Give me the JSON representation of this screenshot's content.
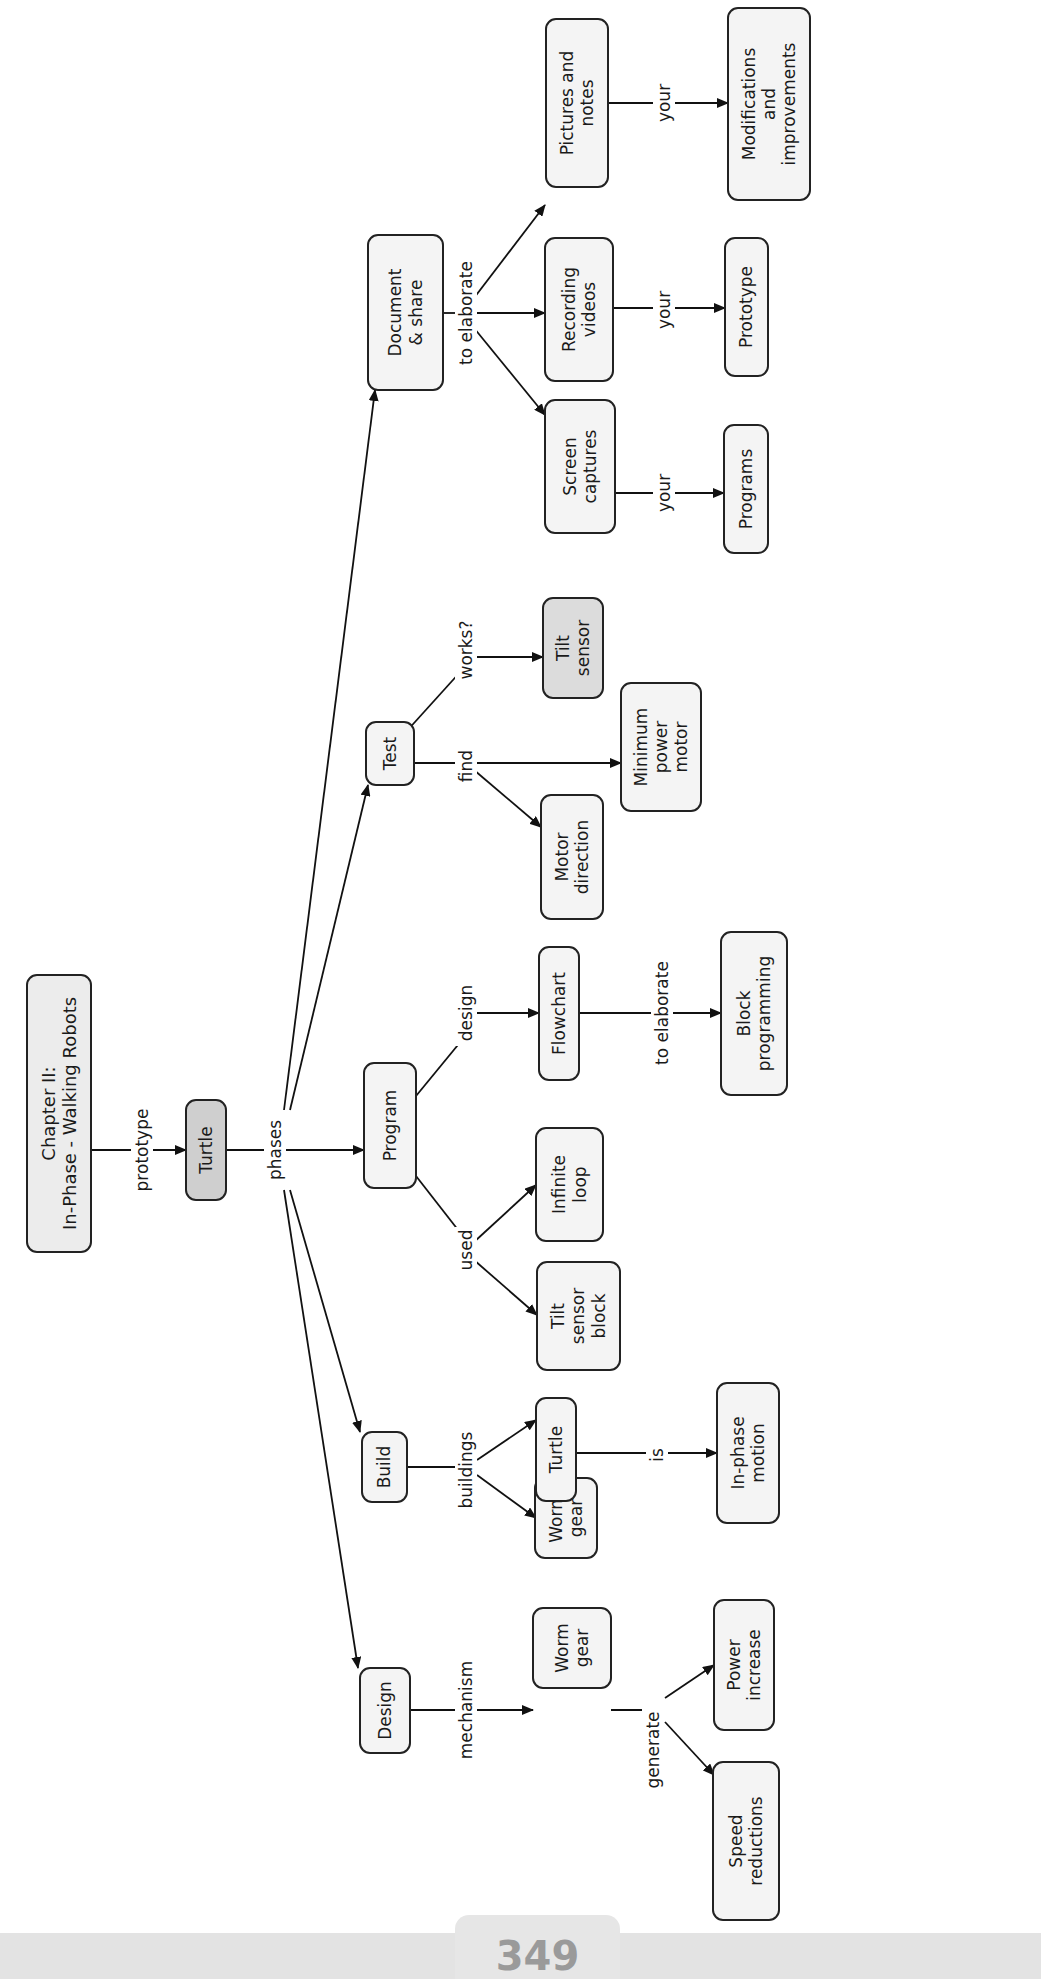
{
  "diagram": {
    "colors": {
      "root_fill": "#ececec",
      "highlight_fill": "#cfcfcf",
      "node_fill": "#f4f4f4",
      "stroke": "#222222",
      "footer": "#e3e3e3",
      "page_number": "#9a9a9a"
    },
    "nodes": [
      {
        "id": "root",
        "lines": [
          "Chapter II:",
          "In-Phase - Walking Robots"
        ],
        "x": 27,
        "y": 975,
        "w": 64,
        "h": 277,
        "fill": "#ececec"
      },
      {
        "id": "turtle",
        "lines": [
          "Turtle"
        ],
        "x": 186,
        "y": 1100,
        "w": 40,
        "h": 100,
        "fill": "#cfcfcf"
      },
      {
        "id": "design",
        "lines": [
          "Design"
        ],
        "x": 360,
        "y": 1668,
        "w": 50,
        "h": 85,
        "fill": "#f4f4f4"
      },
      {
        "id": "build",
        "lines": [
          "Build"
        ],
        "x": 362,
        "y": 1432,
        "w": 45,
        "h": 70,
        "fill": "#f4f4f4"
      },
      {
        "id": "program",
        "lines": [
          "Program"
        ],
        "x": 364,
        "y": 1063,
        "w": 52,
        "h": 125,
        "fill": "#f4f4f4"
      },
      {
        "id": "test",
        "lines": [
          "Test"
        ],
        "x": 366,
        "y": 722,
        "w": 48,
        "h": 63,
        "fill": "#f4f4f4"
      },
      {
        "id": "document",
        "lines": [
          "Document",
          "& share"
        ],
        "x": 368,
        "y": 235,
        "w": 75,
        "h": 155,
        "fill": "#f4f4f4"
      },
      {
        "id": "worm_gear_design",
        "lines": [
          "Worm",
          "gear"
        ],
        "x": 533,
        "y": 1608,
        "w": 78,
        "h": 80,
        "fill": "#f4f4f4"
      },
      {
        "id": "worm_gear_build",
        "lines": [
          "Worm",
          "gear"
        ],
        "x": 535,
        "y": 1478,
        "w": 62,
        "h": 80,
        "fill": "#f4f4f4"
      },
      {
        "id": "turtle_build",
        "lines": [
          "Turtle"
        ],
        "x": 536,
        "y": 1398,
        "w": 40,
        "h": 103,
        "fill": "#f4f4f4"
      },
      {
        "id": "tilt_sensor_block",
        "lines": [
          "Tilt",
          "sensor",
          "block"
        ],
        "x": 537,
        "y": 1262,
        "w": 83,
        "h": 108,
        "fill": "#f4f4f4"
      },
      {
        "id": "infinite_loop",
        "lines": [
          "Infinite",
          "loop"
        ],
        "x": 536,
        "y": 1128,
        "w": 67,
        "h": 113,
        "fill": "#f4f4f4"
      },
      {
        "id": "flowchart",
        "lines": [
          "Flowchart"
        ],
        "x": 539,
        "y": 947,
        "w": 40,
        "h": 133,
        "fill": "#f4f4f4"
      },
      {
        "id": "motor_direction",
        "lines": [
          "Motor",
          "direction"
        ],
        "x": 541,
        "y": 795,
        "w": 62,
        "h": 124,
        "fill": "#f4f4f4"
      },
      {
        "id": "tilt_sensor",
        "lines": [
          "Tilt",
          "sensor"
        ],
        "x": 543,
        "y": 598,
        "w": 60,
        "h": 100,
        "fill": "#dcdcdc"
      },
      {
        "id": "screen_captures",
        "lines": [
          "Screen",
          "captures"
        ],
        "x": 545,
        "y": 400,
        "w": 70,
        "h": 133,
        "fill": "#f4f4f4"
      },
      {
        "id": "recording_videos",
        "lines": [
          "Recording",
          "videos"
        ],
        "x": 545,
        "y": 238,
        "w": 68,
        "h": 143,
        "fill": "#f4f4f4"
      },
      {
        "id": "pictures_notes",
        "lines": [
          "Pictures and",
          "notes"
        ],
        "x": 546,
        "y": 19,
        "w": 62,
        "h": 168,
        "fill": "#f4f4f4"
      },
      {
        "id": "minimum_power_motor",
        "lines": [
          "Minimum",
          "power",
          "motor"
        ],
        "x": 621,
        "y": 683,
        "w": 80,
        "h": 128,
        "fill": "#f4f4f4"
      },
      {
        "id": "in_phase_motion",
        "lines": [
          "In-phase",
          "motion"
        ],
        "x": 717,
        "y": 1383,
        "w": 62,
        "h": 140,
        "fill": "#f4f4f4"
      },
      {
        "id": "block_programming",
        "lines": [
          "Block",
          "programming"
        ],
        "x": 721,
        "y": 932,
        "w": 66,
        "h": 163,
        "fill": "#f4f4f4"
      },
      {
        "id": "power_increase",
        "lines": [
          "Power",
          "increase"
        ],
        "x": 714,
        "y": 1600,
        "w": 60,
        "h": 130,
        "fill": "#f4f4f4"
      },
      {
        "id": "speed_reductions",
        "lines": [
          "Speed",
          "reductions"
        ],
        "x": 713,
        "y": 1762,
        "w": 66,
        "h": 158,
        "fill": "#f4f4f4"
      },
      {
        "id": "programs",
        "lines": [
          "Programs"
        ],
        "x": 724,
        "y": 425,
        "w": 44,
        "h": 128,
        "fill": "#f4f4f4"
      },
      {
        "id": "prototype",
        "lines": [
          "Prototype"
        ],
        "x": 725,
        "y": 238,
        "w": 43,
        "h": 138,
        "fill": "#f4f4f4"
      },
      {
        "id": "modifications",
        "lines": [
          "Modifications",
          "and",
          "improvements"
        ],
        "x": 728,
        "y": 8,
        "w": 82,
        "h": 192,
        "fill": "#f4f4f4"
      }
    ],
    "edge_labels": [
      {
        "id": "label_prototype",
        "text": "prototype",
        "x": 142,
        "y": 1150
      },
      {
        "id": "label_phases",
        "text": "phases",
        "x": 275,
        "y": 1150
      },
      {
        "id": "label_mechanism",
        "text": "mechanism",
        "x": 466,
        "y": 1710
      },
      {
        "id": "label_buildings",
        "text": "buildings",
        "x": 466,
        "y": 1470
      },
      {
        "id": "label_used",
        "text": "used",
        "x": 466,
        "y": 1250
      },
      {
        "id": "label_design",
        "text": "design",
        "x": 466,
        "y": 1013
      },
      {
        "id": "label_find",
        "text": "find",
        "x": 466,
        "y": 766
      },
      {
        "id": "label_works",
        "text": "works?",
        "x": 466,
        "y": 650
      },
      {
        "id": "label_to_elaborate_doc",
        "text": "to elaborate",
        "x": 466,
        "y": 313
      },
      {
        "id": "label_is",
        "text": "is",
        "x": 657,
        "y": 1455
      },
      {
        "id": "label_to_elaborate_flow",
        "text": "to elaborate",
        "x": 662,
        "y": 1013
      },
      {
        "id": "label_generate",
        "text": "generate",
        "x": 653,
        "y": 1750
      },
      {
        "id": "label_your_programs",
        "text": "your",
        "x": 664,
        "y": 493
      },
      {
        "id": "label_your_prototype",
        "text": "your",
        "x": 664,
        "y": 310
      },
      {
        "id": "label_your_modifications",
        "text": "your",
        "x": 664,
        "y": 103
      }
    ],
    "edges": [
      {
        "from": "root",
        "to": "turtle",
        "pts": [
          [
            91,
            1150
          ],
          [
            186,
            1150
          ]
        ],
        "arrow": true
      },
      {
        "from": "turtle",
        "to": "program",
        "pts": [
          [
            226,
            1150
          ],
          [
            364,
            1150
          ]
        ],
        "arrow": true
      },
      {
        "from": "phases",
        "to": "design",
        "pts": [
          [
            284,
            1190
          ],
          [
            358,
            1668
          ]
        ],
        "arrow": true
      },
      {
        "from": "phases",
        "to": "build",
        "pts": [
          [
            290,
            1190
          ],
          [
            360,
            1432
          ]
        ],
        "arrow": true
      },
      {
        "from": "phases",
        "to": "test",
        "pts": [
          [
            290,
            1110
          ],
          [
            368,
            785
          ]
        ],
        "arrow": true
      },
      {
        "from": "phases",
        "to": "document",
        "pts": [
          [
            284,
            1110
          ],
          [
            375,
            390
          ]
        ],
        "arrow": true
      },
      {
        "from": "design",
        "to": "worm_gear_design",
        "pts": [
          [
            410,
            1710
          ],
          [
            533,
            1710
          ]
        ],
        "arrow": true
      },
      {
        "from": "worm_gear_design",
        "to": "split_generate",
        "pts": [
          [
            611,
            1710
          ],
          [
            650,
            1710
          ]
        ],
        "arrow": false
      },
      {
        "from": "generate",
        "to": "power_increase",
        "pts": [
          [
            665,
            1698
          ],
          [
            714,
            1665
          ]
        ],
        "arrow": true
      },
      {
        "from": "generate",
        "to": "speed_reductions",
        "pts": [
          [
            665,
            1722
          ],
          [
            714,
            1775
          ]
        ],
        "arrow": true
      },
      {
        "from": "build",
        "to": "split_buildings",
        "pts": [
          [
            407,
            1467
          ],
          [
            460,
            1467
          ]
        ],
        "arrow": false
      },
      {
        "from": "buildings",
        "to": "turtle_build",
        "pts": [
          [
            477,
            1460
          ],
          [
            536,
            1420
          ]
        ],
        "arrow": true
      },
      {
        "from": "buildings",
        "to": "worm_gear_build",
        "pts": [
          [
            477,
            1475
          ],
          [
            536,
            1518
          ]
        ],
        "arrow": true
      },
      {
        "from": "turtle_build",
        "to": "in_phase_motion",
        "pts": [
          [
            576,
            1453
          ],
          [
            717,
            1453
          ]
        ],
        "arrow": true
      },
      {
        "from": "program",
        "to": "used",
        "pts": [
          [
            416,
            1176
          ],
          [
            462,
            1235
          ]
        ],
        "arrow": false
      },
      {
        "from": "used",
        "to": "infinite_loop",
        "pts": [
          [
            474,
            1242
          ],
          [
            536,
            1185
          ]
        ],
        "arrow": true
      },
      {
        "from": "used",
        "to": "tilt_sensor_block",
        "pts": [
          [
            474,
            1260
          ],
          [
            537,
            1315
          ]
        ],
        "arrow": true
      },
      {
        "from": "program",
        "to": "design_lbl",
        "pts": [
          [
            416,
            1096
          ],
          [
            462,
            1040
          ]
        ],
        "arrow": false
      },
      {
        "from": "design_lbl",
        "to": "flowchart",
        "pts": [
          [
            474,
            1013
          ],
          [
            539,
            1013
          ]
        ],
        "arrow": true
      },
      {
        "from": "flowchart",
        "to": "block_programming",
        "pts": [
          [
            579,
            1013
          ],
          [
            721,
            1013
          ]
        ],
        "arrow": true
      },
      {
        "from": "test",
        "to": "find_lbl",
        "pts": [
          [
            414,
            763
          ],
          [
            460,
            763
          ]
        ],
        "arrow": false
      },
      {
        "from": "find_lbl",
        "to": "minimum_power_motor",
        "pts": [
          [
            474,
            763
          ],
          [
            621,
            763
          ]
        ],
        "arrow": true
      },
      {
        "from": "find_lbl",
        "to": "motor_direction",
        "pts": [
          [
            474,
            770
          ],
          [
            541,
            827
          ]
        ],
        "arrow": true
      },
      {
        "from": "test",
        "to": "works_lbl",
        "pts": [
          [
            405,
            733
          ],
          [
            462,
            670
          ]
        ],
        "arrow": false
      },
      {
        "from": "works_lbl",
        "to": "tilt_sensor",
        "pts": [
          [
            474,
            657
          ],
          [
            543,
            657
          ]
        ],
        "arrow": true
      },
      {
        "from": "document",
        "to": "elab_lbl",
        "pts": [
          [
            443,
            313
          ],
          [
            458,
            313
          ]
        ],
        "arrow": false
      },
      {
        "from": "elab",
        "to": "recording_videos",
        "pts": [
          [
            474,
            313
          ],
          [
            545,
            313
          ]
        ],
        "arrow": true
      },
      {
        "from": "elab",
        "to": "pictures_notes",
        "pts": [
          [
            474,
            298
          ],
          [
            545,
            205
          ]
        ],
        "arrow": true
      },
      {
        "from": "elab",
        "to": "screen_captures",
        "pts": [
          [
            474,
            328
          ],
          [
            545,
            415
          ]
        ],
        "arrow": true
      },
      {
        "from": "screen_captures",
        "to": "programs",
        "pts": [
          [
            615,
            493
          ],
          [
            724,
            493
          ]
        ],
        "arrow": true
      },
      {
        "from": "recording_videos",
        "to": "prototype",
        "pts": [
          [
            613,
            308
          ],
          [
            725,
            308
          ]
        ],
        "arrow": true
      },
      {
        "from": "pictures_notes",
        "to": "modifications",
        "pts": [
          [
            608,
            103
          ],
          [
            728,
            103
          ]
        ],
        "arrow": true
      }
    ]
  },
  "footer": {
    "page_number": "349"
  }
}
